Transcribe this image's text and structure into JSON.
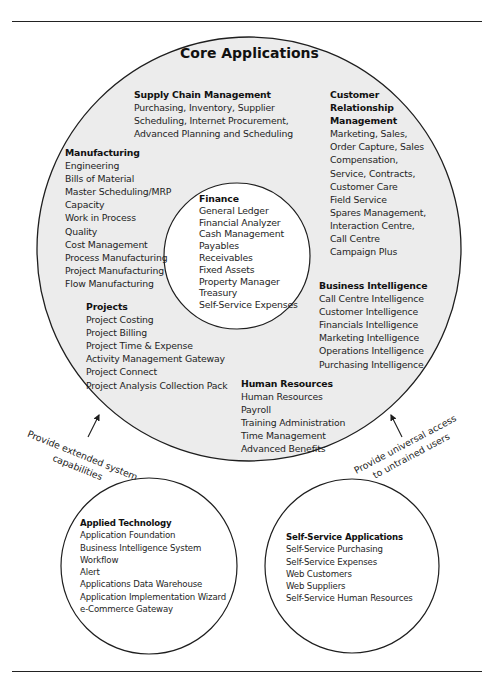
{
  "title": "Core Applications",
  "core": {
    "supply_chain": {
      "heading": "Supply Chain Management",
      "items": [
        "Purchasing, Inventory, Supplier",
        "Scheduling, Internet Procurement,",
        "Advanced Planning and Scheduling"
      ]
    },
    "crm": {
      "heading_lines": [
        "Customer",
        "Relationship",
        "Management"
      ],
      "items": [
        "Marketing, Sales,",
        "Order Capture, Sales",
        "Compensation,",
        "Service, Contracts,",
        "Customer Care",
        "Field Service",
        "Spares Management,",
        "Interaction Centre,",
        "Call Centre",
        "Campaign Plus"
      ]
    },
    "manufacturing": {
      "heading": "Manufacturing",
      "items": [
        "Engineering",
        "Bills of Material",
        "Master Scheduling/MRP",
        "Capacity",
        "Work in Process",
        "Quality",
        "Cost Management",
        "Process Manufacturing",
        "Project Manufacturing",
        "Flow Manufacturing"
      ]
    },
    "finance": {
      "heading": "Finance",
      "items": [
        "General Ledger",
        "Financial Analyzer",
        "Cash Management",
        "Payables",
        "Receivables",
        "Fixed Assets",
        "Property Manager",
        "Treasury",
        "Self-Service Expenses"
      ]
    },
    "business_intelligence": {
      "heading": "Business Intelligence",
      "items": [
        "Call Centre Intelligence",
        "Customer Intelligence",
        "Financials Intelligence",
        "Marketing Intelligence",
        "Operations Intelligence",
        "Purchasing Intelligence"
      ]
    },
    "projects": {
      "heading": "Projects",
      "items": [
        "Project Costing",
        "Project Billing",
        "Project Time & Expense",
        "Activity Management Gateway",
        "Project Connect",
        "Project Analysis Collection Pack"
      ]
    },
    "human_resources": {
      "heading": "Human Resources",
      "items": [
        "Human Resources",
        "Payroll",
        "Training Administration",
        "Time Management",
        "Advanced Benefits"
      ]
    }
  },
  "applied_technology": {
    "heading": "Applied Technology",
    "items": [
      "Application Foundation",
      "Business Intelligence System",
      "Workflow",
      "Alert",
      "Applications Data Warehouse",
      "Application Implementation Wizard",
      "e-Commerce Gateway"
    ]
  },
  "self_service": {
    "heading": "Self-Service Applications",
    "items": [
      "Self-Service Purchasing",
      "Self-Service Expenses",
      "Web Customers",
      "Web Suppliers",
      "Self-Service Human Resources"
    ]
  },
  "connectors": {
    "left": [
      "Provide extended system",
      "capabilities"
    ],
    "right": [
      "Provide universal access",
      "to untrained users"
    ]
  },
  "colors": {
    "core_fill": "#ececec",
    "inner_fill": "#ffffff",
    "stroke": "#1e1e1e"
  }
}
